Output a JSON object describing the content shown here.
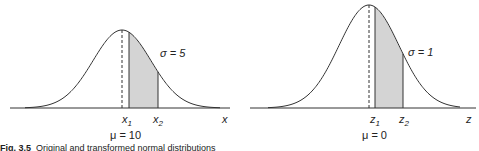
{
  "figure": {
    "caption_label": "Fig. 3.5",
    "caption_text": "Original and transformed normal distributions"
  },
  "chart_data": [
    {
      "type": "area",
      "title": "Original normal distribution",
      "curve": "normal",
      "mean_label": "μ = 10",
      "sigma_label": "σ = 5",
      "axis_label": "x",
      "bound_labels": [
        "x",
        "x"
      ],
      "bound_subscripts": [
        "1",
        "2"
      ],
      "shaded_region": "between x1 and x2",
      "mean": 10,
      "sigma": 5
    },
    {
      "type": "area",
      "title": "Standard normal distribution",
      "curve": "normal",
      "mean_label": "μ = 0",
      "sigma_label": "σ = 1",
      "axis_label": "z",
      "bound_labels": [
        "z",
        "z"
      ],
      "bound_subscripts": [
        "1",
        "2"
      ],
      "shaded_region": "between z1 and z2",
      "mean": 0,
      "sigma": 1
    }
  ],
  "labels": {
    "left": {
      "sigma": "σ = 5",
      "mu": "μ = 10",
      "axis": "x",
      "b1": "x",
      "b1_sub": "1",
      "b2": "x",
      "b2_sub": "2"
    },
    "right": {
      "sigma": "σ = 1",
      "mu": "μ = 0",
      "axis": "z",
      "b1": "z",
      "b1_sub": "1",
      "b2": "z",
      "b2_sub": "2"
    }
  },
  "colors": {
    "line": "#333333",
    "shade": "#d4d4d4"
  }
}
